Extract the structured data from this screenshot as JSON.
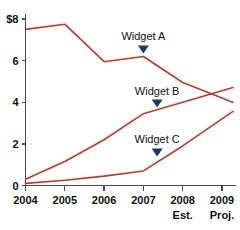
{
  "chart_data": {
    "type": "line",
    "title": "",
    "subtitle": "",
    "xlabel": "",
    "ylabel": "",
    "x": [
      "2004",
      "2005",
      "2006",
      "2007",
      "2008",
      "2009"
    ],
    "xtick_labels": [
      "2004",
      "2005",
      "2006",
      "2007",
      "2008",
      "2009"
    ],
    "xtick_sublabels": [
      "",
      "",
      "",
      "",
      "Est.",
      "Proj."
    ],
    "ytick_labels": [
      "0",
      "2",
      "4",
      "6",
      "$8"
    ],
    "ytick_values": [
      0,
      2,
      4,
      6,
      8
    ],
    "ylim": [
      0,
      8.4
    ],
    "xlim": [
      2004,
      2009.2
    ],
    "grid": false,
    "legend_position": "inline-annotations",
    "series": [
      {
        "name": "Widget A",
        "color": "#c0392b",
        "values": [
          7.5,
          7.75,
          5.95,
          6.2,
          4.95,
          4.2
        ]
      },
      {
        "name": "Widget B",
        "color": "#c0392b",
        "values": [
          0.3,
          1.15,
          2.2,
          3.45,
          4.0,
          4.55
        ]
      },
      {
        "name": "Widget C",
        "color": "#c0392b",
        "values": [
          0.1,
          0.25,
          0.45,
          0.7,
          1.9,
          3.2
        ]
      }
    ],
    "annotations": [
      {
        "text": "Widget A",
        "series": "Widget A",
        "x": 2007.0,
        "y": 6.2,
        "marker": "down-triangle",
        "marker_color": "#1b3a6b"
      },
      {
        "text": "Widget B",
        "series": "Widget B",
        "x": 2007.35,
        "y": 3.6,
        "marker": "down-triangle",
        "marker_color": "#1b3a6b"
      },
      {
        "text": "Widget C",
        "series": "Widget C",
        "x": 2007.35,
        "y": 1.25,
        "marker": "down-triangle",
        "marker_color": "#1b3a6b"
      }
    ],
    "colors": {
      "line": "#c0392b",
      "axis": "#4a4a4a",
      "marker": "#1b3a6b",
      "text": "#111111",
      "background": "#ffffff"
    }
  }
}
